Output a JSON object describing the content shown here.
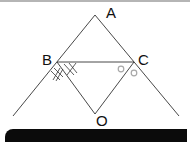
{
  "diagram": {
    "type": "geometry",
    "points": [
      {
        "name": "A",
        "label": "A",
        "x": 95,
        "y": 15
      },
      {
        "name": "B",
        "label": "B",
        "x": 57,
        "y": 62
      },
      {
        "name": "C",
        "label": "C",
        "x": 134,
        "y": 62
      },
      {
        "name": "O",
        "label": "O",
        "x": 95,
        "y": 114
      }
    ],
    "segments": [
      {
        "from": "A",
        "to": "left-end",
        "note": "line AB extended"
      },
      {
        "from": "A",
        "to": "right-end",
        "note": "line AC extended"
      },
      {
        "from": "B",
        "to": "C"
      },
      {
        "from": "B",
        "to": "O"
      },
      {
        "from": "C",
        "to": "O"
      }
    ],
    "angle_marks": {
      "B": "double-cross (equal angles)",
      "C": "circle (equal angles)"
    },
    "colors": {
      "line": "#333333",
      "circle_mark": "#a8a8a8",
      "bar": "#0b0b0b"
    }
  }
}
